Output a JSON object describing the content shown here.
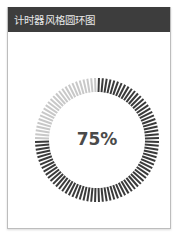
{
  "header": {
    "title": "计时器风格圆环图"
  },
  "gauge": {
    "value_label": "75%",
    "percent": 75,
    "tick_count": 100,
    "active_color": "#3a3a3a",
    "inactive_color": "#c8c8c8"
  },
  "chart_data": {
    "type": "pie",
    "title": "计时器风格圆环图",
    "categories": [
      "completed",
      "remaining"
    ],
    "values": [
      75,
      25
    ],
    "center_label": "75%"
  }
}
